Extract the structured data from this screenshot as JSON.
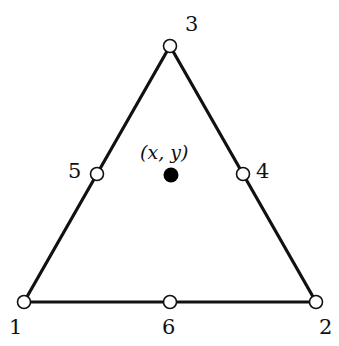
{
  "diagram": {
    "type": "triangular finite element",
    "nodes": [
      {
        "id": "1",
        "label": "1",
        "x": 24,
        "y": 302,
        "style": "open"
      },
      {
        "id": "2",
        "label": "2",
        "x": 316,
        "y": 302,
        "style": "open"
      },
      {
        "id": "3",
        "label": "3",
        "x": 170,
        "y": 46,
        "style": "open"
      },
      {
        "id": "4",
        "label": "4",
        "x": 243,
        "y": 174,
        "style": "open"
      },
      {
        "id": "5",
        "label": "5",
        "x": 97,
        "y": 174,
        "style": "open"
      },
      {
        "id": "6",
        "label": "6",
        "x": 170,
        "y": 302,
        "style": "open"
      }
    ],
    "edges": [
      [
        "1",
        "2"
      ],
      [
        "2",
        "3"
      ],
      [
        "3",
        "1"
      ]
    ],
    "interior_point": {
      "label": "(x, y)",
      "x": 171,
      "y": 175,
      "style": "filled"
    },
    "colors": {
      "stroke": "#111111",
      "node_fill": "#ffffff",
      "point_fill": "#000000"
    }
  }
}
